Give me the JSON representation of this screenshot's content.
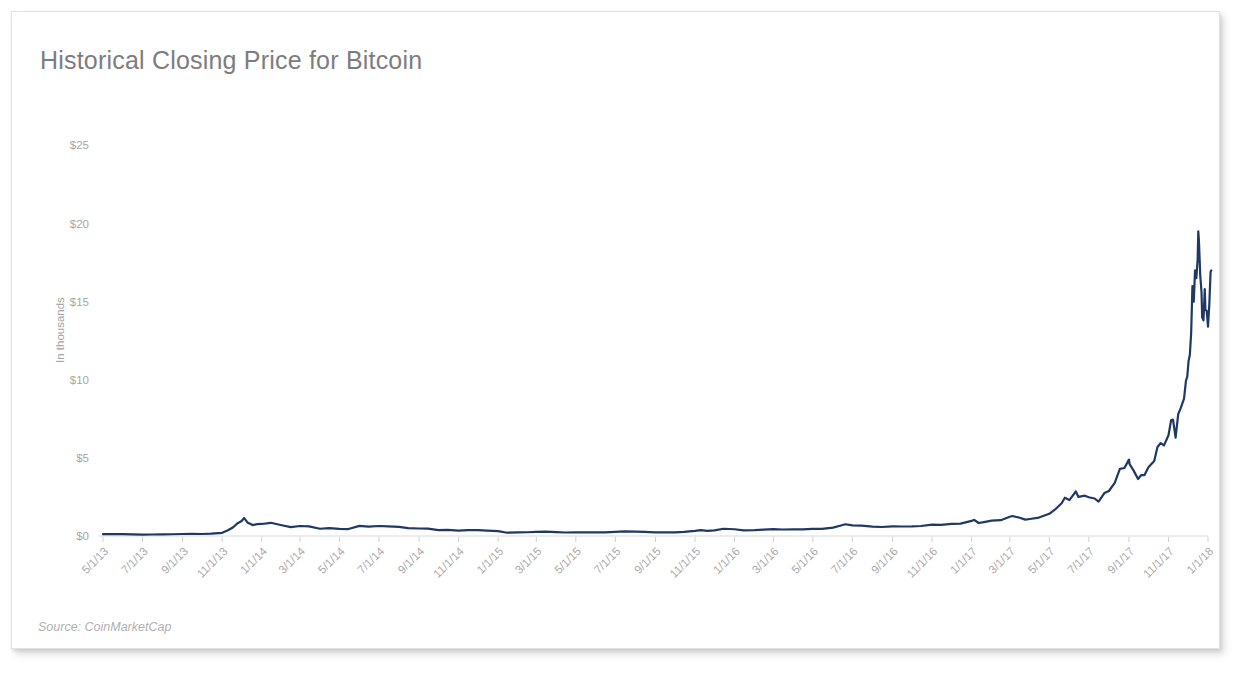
{
  "card": {
    "title": "Historical Closing Price for Bitcoin",
    "source_note": "Source: CoinMarketCap"
  },
  "chart_data": {
    "type": "line",
    "title": "Historical Closing Price for Bitcoin",
    "subtitle": "",
    "xlabel": "",
    "ylabel": "In thousands",
    "annotations": [
      "Source: CoinMarketCap"
    ],
    "legend": [],
    "legend_position": "none",
    "grid": false,
    "line_color": "#1f3864",
    "line_width": 2.2,
    "ylim": [
      0,
      26.5
    ],
    "ytick_labels": [
      "$0",
      "$5",
      "$10",
      "$15",
      "$20",
      "$25"
    ],
    "ytick_values": [
      0,
      5,
      10,
      15,
      20,
      25
    ],
    "xlim": [
      "5/1/13",
      "1/1/18"
    ],
    "xtick_labels": [
      "5/1/13",
      "7/1/13",
      "9/1/13",
      "11/1/13",
      "1/1/14",
      "3/1/14",
      "5/1/14",
      "7/1/14",
      "9/1/14",
      "11/1/14",
      "1/1/15",
      "3/1/15",
      "5/1/15",
      "7/1/15",
      "9/1/15",
      "11/1/15",
      "1/1/16",
      "3/1/16",
      "5/1/16",
      "7/1/16",
      "9/1/16",
      "11/1/16",
      "1/1/17",
      "3/1/17",
      "5/1/17",
      "7/1/17",
      "9/1/17",
      "11/1/17",
      "1/1/18"
    ],
    "series": [
      {
        "name": "Bitcoin closing price",
        "units": "thousands of USD",
        "x": [
          "5/1/13",
          "5/15/13",
          "6/1/13",
          "6/15/13",
          "7/1/13",
          "7/15/13",
          "8/1/13",
          "8/15/13",
          "9/1/13",
          "9/15/13",
          "10/1/13",
          "10/15/13",
          "11/1/13",
          "11/10/13",
          "11/18/13",
          "11/25/13",
          "12/1/13",
          "12/5/13",
          "12/10/13",
          "12/18/13",
          "12/25/13",
          "1/1/14",
          "1/15/14",
          "2/1/14",
          "2/15/14",
          "3/1/14",
          "3/15/14",
          "4/1/14",
          "4/15/14",
          "5/1/14",
          "5/15/14",
          "6/1/14",
          "6/15/14",
          "7/1/14",
          "7/15/14",
          "8/1/14",
          "8/15/14",
          "9/1/14",
          "9/15/14",
          "10/1/14",
          "10/15/14",
          "11/1/14",
          "11/15/14",
          "12/1/14",
          "12/15/14",
          "1/1/15",
          "1/15/15",
          "2/1/15",
          "2/15/15",
          "3/1/15",
          "3/15/15",
          "4/1/15",
          "4/15/15",
          "5/1/15",
          "5/15/15",
          "6/1/15",
          "6/15/15",
          "7/1/15",
          "7/15/15",
          "8/1/15",
          "8/15/15",
          "9/1/15",
          "9/15/15",
          "10/1/15",
          "10/15/15",
          "11/1/15",
          "11/10/15",
          "11/20/15",
          "12/1/15",
          "12/15/15",
          "1/1/16",
          "1/15/16",
          "2/1/16",
          "2/15/16",
          "3/1/16",
          "3/15/16",
          "4/1/16",
          "4/15/16",
          "5/1/16",
          "5/15/16",
          "6/1/16",
          "6/12/16",
          "6/20/16",
          "7/1/16",
          "7/15/16",
          "8/1/16",
          "8/15/16",
          "9/1/16",
          "9/15/16",
          "10/1/16",
          "10/15/16",
          "11/1/16",
          "11/15/16",
          "12/1/16",
          "12/15/16",
          "1/1/17",
          "1/5/17",
          "1/12/17",
          "1/20/17",
          "2/1/17",
          "2/15/17",
          "3/1/17",
          "3/5/17",
          "3/15/17",
          "3/25/17",
          "4/1/17",
          "4/15/17",
          "5/1/17",
          "5/10/17",
          "5/20/17",
          "5/25/17",
          "6/1/17",
          "6/11/17",
          "6/15/17",
          "6/25/17",
          "7/1/17",
          "7/10/17",
          "7/16/17",
          "7/25/17",
          "8/1/17",
          "8/10/17",
          "8/18/17",
          "8/25/17",
          "9/1/17",
          "9/2/17",
          "9/8/17",
          "9/15/17",
          "9/20/17",
          "9/25/17",
          "10/1/17",
          "10/10/17",
          "10/15/17",
          "10/20/17",
          "10/25/17",
          "11/1/17",
          "11/5/17",
          "11/8/17",
          "11/12/17",
          "11/16/17",
          "11/20/17",
          "11/25/17",
          "11/28/17",
          "11/30/17",
          "12/2/17",
          "12/4/17",
          "12/6/17",
          "12/8/17",
          "12/10/17",
          "12/12/17",
          "12/14/17",
          "12/16/17",
          "12/17/17",
          "12/18/17",
          "12/20/17",
          "12/22/17",
          "12/23/17",
          "12/25/17",
          "12/27/17",
          "12/28/17",
          "12/30/17",
          "1/1/18",
          "1/3/18",
          "1/5/18",
          "1/6/18"
        ],
        "values": [
          0.117,
          0.123,
          0.122,
          0.11,
          0.082,
          0.095,
          0.104,
          0.113,
          0.128,
          0.135,
          0.127,
          0.15,
          0.205,
          0.365,
          0.56,
          0.82,
          0.955,
          1.147,
          0.87,
          0.7,
          0.76,
          0.77,
          0.845,
          0.685,
          0.565,
          0.64,
          0.615,
          0.465,
          0.5,
          0.45,
          0.445,
          0.645,
          0.6,
          0.64,
          0.615,
          0.585,
          0.5,
          0.48,
          0.475,
          0.38,
          0.395,
          0.34,
          0.38,
          0.378,
          0.35,
          0.315,
          0.21,
          0.235,
          0.24,
          0.265,
          0.285,
          0.247,
          0.223,
          0.235,
          0.237,
          0.23,
          0.232,
          0.258,
          0.29,
          0.285,
          0.265,
          0.23,
          0.23,
          0.238,
          0.264,
          0.33,
          0.38,
          0.33,
          0.36,
          0.465,
          0.432,
          0.365,
          0.375,
          0.41,
          0.435,
          0.415,
          0.418,
          0.428,
          0.45,
          0.455,
          0.535,
          0.66,
          0.75,
          0.675,
          0.665,
          0.605,
          0.575,
          0.61,
          0.608,
          0.613,
          0.64,
          0.73,
          0.71,
          0.77,
          0.79,
          0.97,
          1.03,
          0.83,
          0.89,
          0.98,
          1.01,
          1.23,
          1.28,
          1.185,
          1.05,
          1.09,
          1.18,
          1.42,
          1.7,
          2.1,
          2.45,
          2.3,
          2.85,
          2.5,
          2.58,
          2.48,
          2.4,
          2.2,
          2.75,
          2.88,
          3.4,
          4.3,
          4.35,
          4.89,
          4.6,
          4.2,
          3.65,
          3.9,
          3.9,
          4.4,
          4.8,
          5.7,
          5.95,
          5.8,
          6.45,
          7.4,
          7.45,
          6.3,
          7.8,
          8.2,
          8.8,
          9.95,
          10.2,
          11.2,
          11.6,
          13.0,
          16.0,
          15.0,
          17.0,
          16.5,
          17.7,
          19.5,
          18.9,
          16.7,
          15.6,
          14.0,
          13.8,
          15.8,
          14.5,
          14.4,
          13.4,
          14.8,
          16.9,
          17.0
        ]
      }
    ],
    "notable_points": [
      {
        "label": "late-2013 peak",
        "x": "12/5/13",
        "y": 1.147
      },
      {
        "label": "all-time peak",
        "x": "12/17/17",
        "y": 19.5
      },
      {
        "label": "series start",
        "x": "5/1/13",
        "y": 0.117
      },
      {
        "label": "series end",
        "x": "1/6/18",
        "y": 17.0
      }
    ]
  }
}
